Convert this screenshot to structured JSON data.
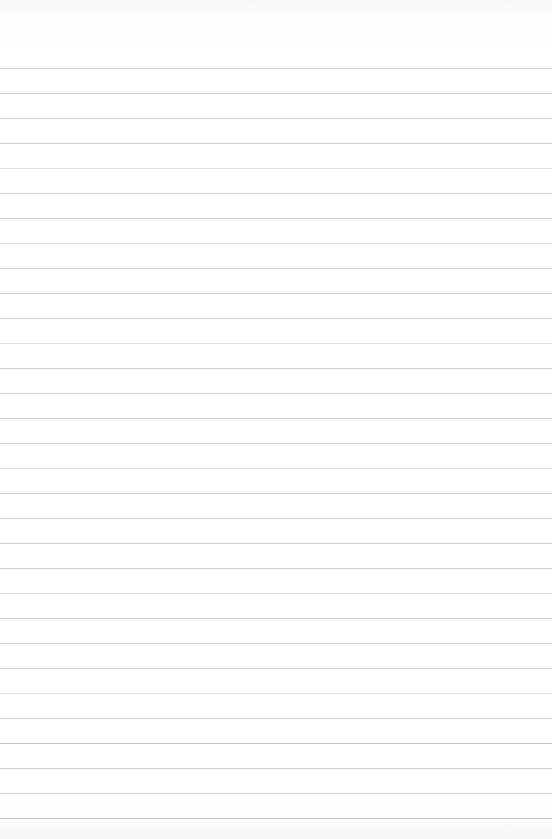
{
  "document": {
    "kind": "ruled-notebook-paper",
    "page_width": 552,
    "page_height": 839,
    "background_color": "#ffffff",
    "written_content": "",
    "has_text": false,
    "has_handwriting": false,
    "has_margin_rule": false,
    "has_header": false,
    "has_footer": false,
    "has_page_number": false
  },
  "ruling": {
    "line_color": "#c9cbd0",
    "line_thickness_px": 1,
    "line_spacing_px": 25,
    "first_line_y": 68,
    "last_line_y": 818,
    "line_count": 31,
    "left_inset_px": 0,
    "right_inset_px": 0,
    "top_margin_px": 68,
    "bottom_margin_px": 21,
    "lines": [
      {
        "y": 68,
        "weight": "normal"
      },
      {
        "y": 93,
        "weight": "normal"
      },
      {
        "y": 118,
        "weight": "normal"
      },
      {
        "y": 143,
        "weight": "normal"
      },
      {
        "y": 168,
        "weight": "faint"
      },
      {
        "y": 193,
        "weight": "normal"
      },
      {
        "y": 218,
        "weight": "normal"
      },
      {
        "y": 243,
        "weight": "faint"
      },
      {
        "y": 268,
        "weight": "normal"
      },
      {
        "y": 293,
        "weight": "normal"
      },
      {
        "y": 318,
        "weight": "normal"
      },
      {
        "y": 343,
        "weight": "faint"
      },
      {
        "y": 368,
        "weight": "normal"
      },
      {
        "y": 393,
        "weight": "normal"
      },
      {
        "y": 418,
        "weight": "normal"
      },
      {
        "y": 443,
        "weight": "normal"
      },
      {
        "y": 468,
        "weight": "faint"
      },
      {
        "y": 493,
        "weight": "normal"
      },
      {
        "y": 518,
        "weight": "normal"
      },
      {
        "y": 543,
        "weight": "normal"
      },
      {
        "y": 568,
        "weight": "normal"
      },
      {
        "y": 593,
        "weight": "faint"
      },
      {
        "y": 618,
        "weight": "normal"
      },
      {
        "y": 643,
        "weight": "normal"
      },
      {
        "y": 668,
        "weight": "normal"
      },
      {
        "y": 693,
        "weight": "faint"
      },
      {
        "y": 718,
        "weight": "normal"
      },
      {
        "y": 743,
        "weight": "strong"
      },
      {
        "y": 768,
        "weight": "normal"
      },
      {
        "y": 793,
        "weight": "normal"
      },
      {
        "y": 818,
        "weight": "strong"
      }
    ]
  }
}
